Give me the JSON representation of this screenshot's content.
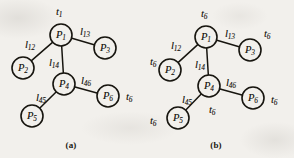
{
  "figure": {
    "background_color": "#f2f0ec",
    "ink_color": "#17150f",
    "node_radius": 11,
    "panels": [
      {
        "id": "a",
        "caption": "(a)",
        "caption_x": 71,
        "caption_y": 140,
        "nodes": [
          {
            "id": "P1",
            "base": "P",
            "sub": "1",
            "cx": 61,
            "cy": 35
          },
          {
            "id": "P2",
            "base": "P",
            "sub": "2",
            "cx": 23,
            "cy": 68
          },
          {
            "id": "P3",
            "base": "P",
            "sub": "3",
            "cx": 105,
            "cy": 48
          },
          {
            "id": "P4",
            "base": "P",
            "sub": "4",
            "cx": 64,
            "cy": 84
          },
          {
            "id": "P5",
            "base": "P",
            "sub": "5",
            "cx": 32,
            "cy": 116
          },
          {
            "id": "P6",
            "base": "P",
            "sub": "6",
            "cx": 108,
            "cy": 96
          }
        ],
        "edges": [
          {
            "id": "l12",
            "from": "P1",
            "to": "P2"
          },
          {
            "id": "l13",
            "from": "P1",
            "to": "P3"
          },
          {
            "id": "l14",
            "from": "P1",
            "to": "P4"
          },
          {
            "id": "l45",
            "from": "P4",
            "to": "P5"
          },
          {
            "id": "l46",
            "from": "P4",
            "to": "P6"
          }
        ],
        "link_labels": [
          {
            "id": "l12",
            "base": "l",
            "sub": "12",
            "x": 25,
            "y": 40
          },
          {
            "id": "l13",
            "base": "l",
            "sub": "13",
            "x": 80,
            "y": 27
          },
          {
            "id": "l14",
            "base": "l",
            "sub": "14",
            "x": 49,
            "y": 58
          },
          {
            "id": "l45",
            "base": "l",
            "sub": "45",
            "x": 36,
            "y": 93
          },
          {
            "id": "l46",
            "base": "l",
            "sub": "46",
            "x": 81,
            "y": 76
          }
        ],
        "time_labels": [
          {
            "id": "t1-at-P1",
            "base": "t",
            "sub": "1",
            "x": 56,
            "y": 7
          },
          {
            "id": "t6-at-P6",
            "base": "t",
            "sub": "6",
            "x": 126,
            "y": 92
          }
        ]
      },
      {
        "id": "b",
        "caption": "(b)",
        "caption_x": 216,
        "caption_y": 140,
        "nodes": [
          {
            "id": "P1",
            "base": "P",
            "sub": "1",
            "cx": 206,
            "cy": 37
          },
          {
            "id": "P2",
            "base": "P",
            "sub": "2",
            "cx": 170,
            "cy": 70
          },
          {
            "id": "P3",
            "base": "P",
            "sub": "3",
            "cx": 250,
            "cy": 50
          },
          {
            "id": "P4",
            "base": "P",
            "sub": "4",
            "cx": 209,
            "cy": 86
          },
          {
            "id": "P5",
            "base": "P",
            "sub": "5",
            "cx": 178,
            "cy": 118
          },
          {
            "id": "P6",
            "base": "P",
            "sub": "6",
            "cx": 253,
            "cy": 98
          }
        ],
        "edges": [
          {
            "id": "l12",
            "from": "P1",
            "to": "P2"
          },
          {
            "id": "l13",
            "from": "P1",
            "to": "P3"
          },
          {
            "id": "l14",
            "from": "P1",
            "to": "P4"
          },
          {
            "id": "l45",
            "from": "P4",
            "to": "P5"
          },
          {
            "id": "l46",
            "from": "P4",
            "to": "P6"
          }
        ],
        "link_labels": [
          {
            "id": "l12",
            "base": "l",
            "sub": "12",
            "x": 171,
            "y": 41
          },
          {
            "id": "l13",
            "base": "l",
            "sub": "13",
            "x": 225,
            "y": 29
          },
          {
            "id": "l14",
            "base": "l",
            "sub": "14",
            "x": 195,
            "y": 60
          },
          {
            "id": "l45",
            "base": "l",
            "sub": "45",
            "x": 182,
            "y": 95
          },
          {
            "id": "l46",
            "base": "l",
            "sub": "46",
            "x": 226,
            "y": 78
          }
        ],
        "time_labels": [
          {
            "id": "t6-at-P1",
            "base": "t",
            "sub": "6",
            "x": 201,
            "y": 9
          },
          {
            "id": "t6-at-P2",
            "base": "t",
            "sub": "6",
            "x": 150,
            "y": 57
          },
          {
            "id": "t6-at-P3",
            "base": "t",
            "sub": "6",
            "x": 264,
            "y": 29
          },
          {
            "id": "t6-at-P4",
            "base": "t",
            "sub": "6",
            "x": 209,
            "y": 105
          },
          {
            "id": "t6-at-P5",
            "base": "t",
            "sub": "6",
            "x": 150,
            "y": 116
          },
          {
            "id": "t6-at-P6",
            "base": "t",
            "sub": "6",
            "x": 271,
            "y": 95
          }
        ]
      }
    ]
  }
}
